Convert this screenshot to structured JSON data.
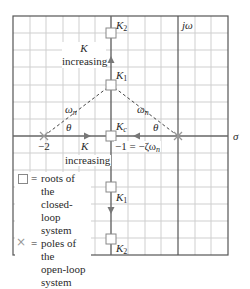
{
  "diagram": {
    "axes": {
      "real_axis_label": "σ",
      "imag_axis_label": "jω"
    },
    "labels": {
      "k2_top": "K",
      "k2_top_sub": "2",
      "k1_top": "K",
      "k1_top_sub": "1",
      "kc": "K",
      "kc_sub": "c",
      "k1_bottom": "K",
      "k1_bottom_sub": "1",
      "k2_bottom": "K",
      "k2_bottom_sub": "2",
      "k_increasing_top_k": "K",
      "k_increasing_top_text": "increasing",
      "k_increasing_mid_k": "K",
      "k_increasing_mid_text": "increasing",
      "omega_n_left": "ω",
      "omega_n_left_sub": "n",
      "omega_n_right": "ω",
      "omega_n_right_sub": "n",
      "theta_left": "θ",
      "theta_right": "θ",
      "minus_two": "−2",
      "breakaway": "−1 = −ζω",
      "breakaway_sub": "n"
    },
    "legend": {
      "items": [
        {
          "symbol": "square",
          "line1": "roots of the",
          "line2": "closed-loop",
          "line3": "system"
        },
        {
          "symbol": "cross",
          "line1": "poles of the",
          "line2": "open-loop",
          "line3": "system"
        }
      ],
      "equals": "="
    },
    "open_loop_poles": [
      {
        "re": 0,
        "im": 0
      },
      {
        "re": -2,
        "im": 0
      }
    ],
    "breakaway_point": {
      "re": -1,
      "im": 0
    },
    "closed_loop_roots": [
      "K2 (upper)",
      "K1 (upper)",
      "Kc",
      "K1 (lower)",
      "K2 (lower)"
    ],
    "colors": {
      "grid": "#c8c8c8",
      "frame": "#555555",
      "axis": "#555555",
      "locus": "#666666",
      "arrow": "#777777",
      "pole": "#999999"
    }
  }
}
